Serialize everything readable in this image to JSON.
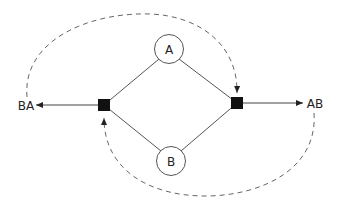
{
  "diagram": {
    "nodes": {
      "a": "A",
      "b": "B"
    },
    "outputs": {
      "left": "BA",
      "right": "AB"
    },
    "colors": {
      "line": "#555555",
      "dashed": "#666666",
      "junction": "#111111"
    }
  }
}
